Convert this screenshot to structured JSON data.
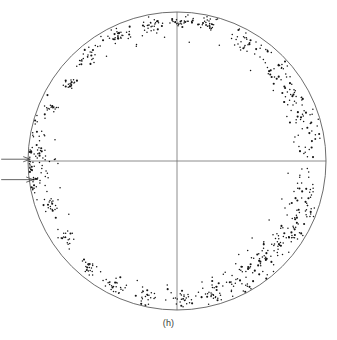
{
  "figure": {
    "caption": "(h)",
    "type": "stereographic-pole-figure",
    "colors": {
      "outline": "#5c5c5c",
      "axis": "#6e6e6e",
      "point": "#141414",
      "background": "#ffffff",
      "annotation": "#3d3d3d"
    }
  },
  "chart_data": {
    "type": "scatter",
    "title": "",
    "subtitle": "",
    "xlabel": "",
    "ylabel": "",
    "caption": "(h)",
    "projection": "stereographic",
    "grid": false,
    "legend_position": "none",
    "xlim": [
      -1,
      1
    ],
    "ylim": [
      -1,
      1
    ],
    "axis_lines": [
      {
        "name": "horizontal-axis",
        "from": [
          -1,
          0
        ],
        "to": [
          1,
          0
        ]
      },
      {
        "name": "vertical-axis",
        "from": [
          0,
          -1
        ],
        "to": [
          0,
          1
        ]
      }
    ],
    "outline_circle": {
      "center": [
        0,
        0
      ],
      "radius": 1.0
    },
    "geometry_px": {
      "center_x": 177,
      "center_y": 161,
      "radius": 149
    },
    "annotations": [
      {
        "name": "arrow-upper-left",
        "label": "",
        "tip": [
          -0.985,
          0.012
        ],
        "tail": [
          -1.18,
          0.012
        ]
      },
      {
        "name": "arrow-lower-left",
        "label": "",
        "tip": [
          -0.965,
          -0.125
        ],
        "tail": [
          -1.18,
          -0.125
        ]
      }
    ],
    "clusters": [
      {
        "id": "c01",
        "angle_deg": 88,
        "radius": 0.93,
        "n": 26,
        "spread": 0.03,
        "tightness": "tight"
      },
      {
        "id": "c02",
        "angle_deg": 77,
        "radius": 0.94,
        "n": 30,
        "spread": 0.034,
        "tightness": "tight"
      },
      {
        "id": "c03",
        "angle_deg": 101,
        "radius": 0.92,
        "n": 28,
        "spread": 0.036,
        "tightness": "tight"
      },
      {
        "id": "c04",
        "angle_deg": 115,
        "radius": 0.93,
        "n": 32,
        "spread": 0.038,
        "tightness": "tight"
      },
      {
        "id": "c05",
        "angle_deg": 130,
        "radius": 0.92,
        "n": 26,
        "spread": 0.034,
        "tightness": "tight"
      },
      {
        "id": "c06",
        "angle_deg": 144,
        "radius": 0.9,
        "n": 20,
        "spread": 0.026,
        "tightness": "tight"
      },
      {
        "id": "c07",
        "angle_deg": 158,
        "radius": 0.92,
        "n": 18,
        "spread": 0.024,
        "tightness": "tight"
      },
      {
        "id": "c08",
        "angle_deg": 176,
        "radius": 0.96,
        "n": 46,
        "spread": 0.06,
        "tightness": "diffuse"
      },
      {
        "id": "c09",
        "angle_deg": 187,
        "radius": 0.94,
        "n": 40,
        "spread": 0.055,
        "tightness": "diffuse"
      },
      {
        "id": "c10",
        "angle_deg": 200,
        "radius": 0.88,
        "n": 16,
        "spread": 0.024,
        "tightness": "tight"
      },
      {
        "id": "c11",
        "angle_deg": 215,
        "radius": 0.9,
        "n": 20,
        "spread": 0.028,
        "tightness": "tight"
      },
      {
        "id": "c12",
        "angle_deg": 230,
        "radius": 0.92,
        "n": 22,
        "spread": 0.03,
        "tightness": "tight"
      },
      {
        "id": "c13",
        "angle_deg": 244,
        "radius": 0.93,
        "n": 26,
        "spread": 0.036,
        "tightness": "tight"
      },
      {
        "id": "c14",
        "angle_deg": 257,
        "radius": 0.93,
        "n": 24,
        "spread": 0.038,
        "tightness": "tight"
      },
      {
        "id": "c15",
        "angle_deg": 272,
        "radius": 0.93,
        "n": 28,
        "spread": 0.04,
        "tightness": "medium"
      },
      {
        "id": "c16",
        "angle_deg": 285,
        "radius": 0.91,
        "n": 30,
        "spread": 0.044,
        "tightness": "medium"
      },
      {
        "id": "c17",
        "angle_deg": 298,
        "radius": 0.9,
        "n": 36,
        "spread": 0.055,
        "tightness": "diffuse"
      },
      {
        "id": "c18",
        "angle_deg": 310,
        "radius": 0.87,
        "n": 38,
        "spread": 0.058,
        "tightness": "diffuse"
      },
      {
        "id": "c19",
        "angle_deg": 322,
        "radius": 0.88,
        "n": 34,
        "spread": 0.052,
        "tightness": "diffuse"
      },
      {
        "id": "c20",
        "angle_deg": 334,
        "radius": 0.9,
        "n": 32,
        "spread": 0.05,
        "tightness": "diffuse"
      },
      {
        "id": "c21",
        "angle_deg": 347,
        "radius": 0.88,
        "n": 30,
        "spread": 0.048,
        "tightness": "diffuse"
      },
      {
        "id": "c22",
        "angle_deg": 15,
        "radius": 0.89,
        "n": 34,
        "spread": 0.052,
        "tightness": "diffuse"
      },
      {
        "id": "c23",
        "angle_deg": 30,
        "radius": 0.88,
        "n": 32,
        "spread": 0.05,
        "tightness": "diffuse"
      },
      {
        "id": "c24",
        "angle_deg": 45,
        "radius": 0.9,
        "n": 30,
        "spread": 0.046,
        "tightness": "diffuse"
      },
      {
        "id": "c25",
        "angle_deg": 60,
        "radius": 0.92,
        "n": 28,
        "spread": 0.042,
        "tightness": "medium"
      }
    ],
    "stray_points": [
      {
        "angle_deg": 84,
        "radius": 0.8
      },
      {
        "angle_deg": 95,
        "radius": 0.84
      },
      {
        "angle_deg": 70,
        "radius": 0.82
      },
      {
        "angle_deg": 108,
        "radius": 0.83
      },
      {
        "angle_deg": 122,
        "radius": 0.84
      },
      {
        "angle_deg": 52,
        "radius": 0.8
      },
      {
        "angle_deg": 38,
        "radius": 0.79
      },
      {
        "angle_deg": 24,
        "radius": 0.78
      },
      {
        "angle_deg": 8,
        "radius": 0.78
      },
      {
        "angle_deg": 352,
        "radius": 0.76
      },
      {
        "angle_deg": 340,
        "radius": 0.76
      },
      {
        "angle_deg": 328,
        "radius": 0.75
      },
      {
        "angle_deg": 316,
        "radius": 0.74
      },
      {
        "angle_deg": 304,
        "radius": 0.77
      },
      {
        "angle_deg": 292,
        "radius": 0.8
      },
      {
        "angle_deg": 280,
        "radius": 0.82
      },
      {
        "angle_deg": 266,
        "radius": 0.84
      },
      {
        "angle_deg": 252,
        "radius": 0.85
      },
      {
        "angle_deg": 182,
        "radius": 0.8
      },
      {
        "angle_deg": 192,
        "radius": 0.82
      },
      {
        "angle_deg": 170,
        "radius": 0.82
      },
      {
        "angle_deg": 205,
        "radius": 0.8
      },
      {
        "angle_deg": 311,
        "radius": 0.97
      },
      {
        "angle_deg": 299,
        "radius": 0.98
      },
      {
        "angle_deg": 336,
        "radius": 0.97
      },
      {
        "angle_deg": 20,
        "radius": 0.97
      },
      {
        "angle_deg": 47,
        "radius": 0.97
      },
      {
        "angle_deg": 63,
        "radius": 0.97
      }
    ]
  }
}
